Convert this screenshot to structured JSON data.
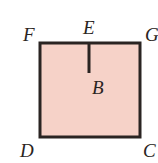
{
  "diagram": {
    "type": "geometry-square",
    "fill_color": "#f6d2c8",
    "stroke_color": "#2a2422",
    "vertices": {
      "F": {
        "label": "F",
        "position": "top-left"
      },
      "G": {
        "label": "G",
        "position": "top-right"
      },
      "D": {
        "label": "D",
        "position": "bottom-left"
      },
      "C": {
        "label": "C",
        "position": "bottom-right"
      }
    },
    "points": {
      "E": {
        "label": "E",
        "position": "midpoint of top edge FG"
      },
      "B": {
        "label": "B",
        "position": "end of segment from E into square"
      }
    },
    "segments": [
      {
        "from": "F",
        "to": "G"
      },
      {
        "from": "G",
        "to": "C"
      },
      {
        "from": "C",
        "to": "D"
      },
      {
        "from": "D",
        "to": "F"
      },
      {
        "from": "E",
        "to": "B"
      }
    ]
  }
}
